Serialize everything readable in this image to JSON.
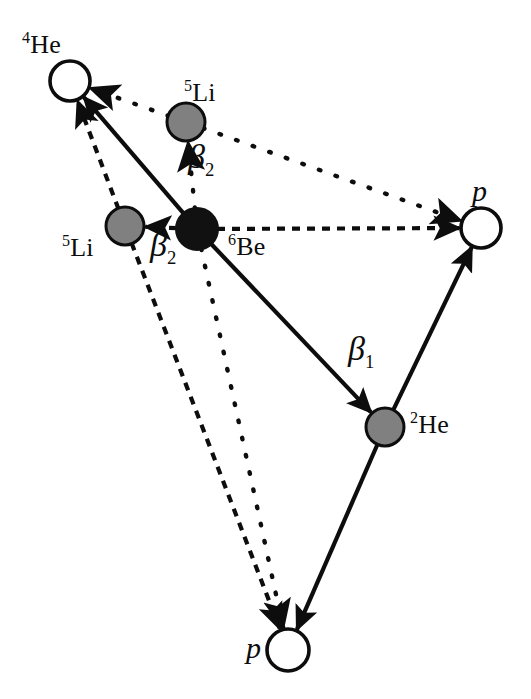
{
  "figure": {
    "type": "decay-scheme-diagram",
    "title": ""
  },
  "colors": {
    "background": "#ffffff",
    "stroke": "#0d0d0d",
    "node_filled": "#111111",
    "node_gray": "#808080",
    "node_open": "#ffffff",
    "label": "#0d0d0d"
  },
  "nodes": [
    {
      "id": "he4",
      "label_html": "<sup>4</sup>He",
      "label_text": "4He",
      "fill": "open",
      "cx": 70,
      "cy": 81,
      "r": 20,
      "label_x": 22,
      "label_y": 30
    },
    {
      "id": "li5_top",
      "label_html": "<sup>5</sup>Li",
      "label_text": "5Li",
      "fill": "gray",
      "cx": 186,
      "cy": 122,
      "r": 19,
      "label_x": 184,
      "label_y": 78
    },
    {
      "id": "li5_left",
      "label_html": "<sup>5</sup>Li",
      "label_text": "5Li",
      "fill": "gray",
      "cx": 125,
      "cy": 226,
      "r": 19,
      "label_x": 62,
      "label_y": 233
    },
    {
      "id": "be6",
      "label_html": "<sup>6</sup>Be",
      "label_text": "6Be",
      "fill": "black",
      "cx": 197,
      "cy": 229,
      "r": 21,
      "label_x": 228,
      "label_y": 232
    },
    {
      "id": "p_right",
      "label_html": "p",
      "label_text": "p",
      "fill": "open",
      "cx": 481,
      "cy": 228,
      "r": 20,
      "label_x": 472,
      "label_y": 176
    },
    {
      "id": "he2",
      "label_html": "<sup>2</sup>He",
      "label_text": "2He",
      "fill": "gray",
      "cx": 385,
      "cy": 427,
      "r": 19,
      "label_x": 410,
      "label_y": 410
    },
    {
      "id": "p_bottom",
      "label_html": "p",
      "label_text": "p",
      "fill": "open",
      "cx": 288,
      "cy": 650,
      "r": 21,
      "label_x": 246,
      "label_y": 633
    }
  ],
  "beta_labels": [
    {
      "id": "beta2_top",
      "greek": "β",
      "sub": "2",
      "x": 188,
      "y": 140
    },
    {
      "id": "beta2_left",
      "greek": "β",
      "sub": "2",
      "x": 150,
      "y": 228
    },
    {
      "id": "beta1",
      "greek": "β",
      "sub": "1",
      "x": 348,
      "y": 332
    }
  ],
  "edges": [
    {
      "id": "be6-to-he4",
      "from": "be6",
      "to": "he4",
      "style": "solid",
      "arrow": "end",
      "x1": 197,
      "y1": 229,
      "x2": 70,
      "y2": 81
    },
    {
      "id": "be6-to-he2",
      "from": "be6",
      "to": "he2",
      "style": "solid",
      "arrow": "end",
      "label": "beta1",
      "x1": 197,
      "y1": 229,
      "x2": 385,
      "y2": 427
    },
    {
      "id": "he2-to-p-right",
      "from": "he2",
      "to": "p_right",
      "style": "solid",
      "arrow": "end",
      "x1": 385,
      "y1": 427,
      "x2": 481,
      "y2": 228
    },
    {
      "id": "he2-to-p-bottom",
      "from": "he2",
      "to": "p_bottom",
      "style": "solid",
      "arrow": "end",
      "x1": 385,
      "y1": 427,
      "x2": 288,
      "y2": 650
    },
    {
      "id": "be6-to-p-right-dashed",
      "from": "be6",
      "to": "p_right",
      "style": "dashed",
      "arrow": "end",
      "x1": 197,
      "y1": 229,
      "x2": 481,
      "y2": 228
    },
    {
      "id": "be6-to-li5-left-dashed",
      "from": "be6",
      "to": "li5_left",
      "style": "dashed",
      "arrow": "end",
      "x1": 197,
      "y1": 229,
      "x2": 125,
      "y2": 226
    },
    {
      "id": "li5-left-to-he4-dashed",
      "from": "li5_left",
      "to": "he4",
      "style": "dashed",
      "arrow": "end",
      "x1": 125,
      "y1": 226,
      "x2": 70,
      "y2": 81
    },
    {
      "id": "li5-left-to-p-bottom-dashed",
      "from": "li5_left",
      "to": "p_bottom",
      "style": "dashed",
      "arrow": "end",
      "x1": 125,
      "y1": 226,
      "x2": 288,
      "y2": 650
    },
    {
      "id": "be6-to-li5-top-dotted",
      "from": "be6",
      "to": "li5_top",
      "style": "dotted",
      "arrow": "end",
      "x1": 197,
      "y1": 229,
      "x2": 186,
      "y2": 122
    },
    {
      "id": "li5-top-to-he4-dotted",
      "from": "li5_top",
      "to": "he4",
      "style": "dotted",
      "arrow": "end",
      "x1": 186,
      "y1": 122,
      "x2": 70,
      "y2": 81
    },
    {
      "id": "li5-top-to-p-right-dotted",
      "from": "li5_top",
      "to": "p_right",
      "style": "dotted",
      "arrow": "end",
      "x1": 186,
      "y1": 122,
      "x2": 481,
      "y2": 228
    },
    {
      "id": "be6-to-p-bottom-dotted",
      "from": "be6",
      "to": "p_bottom",
      "style": "dotted",
      "arrow": "end",
      "x1": 197,
      "y1": 229,
      "x2": 288,
      "y2": 650
    }
  ]
}
